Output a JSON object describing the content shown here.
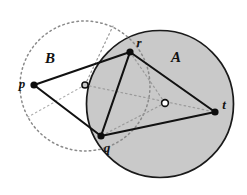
{
  "figure": {
    "width": 247,
    "height": 195,
    "background_color": "#ffffff"
  },
  "colors": {
    "disk_a_fill": "#c9c9c9",
    "disk_a_stroke": "#1a1a1a",
    "circle_b_stroke": "#8a8a8a",
    "segment_stroke": "#111111",
    "dotted_chord_stroke": "#9a9a9a",
    "point_fill": "#0d0d0d",
    "center_ring_stroke": "#111111",
    "center_a_fill": "#ffffff",
    "center_b_fill": "#c9c9c9",
    "label_color": "#111111"
  },
  "regions": [
    {
      "id": "disk-a",
      "label": "A",
      "label_x": 176,
      "label_y": 62,
      "center_x": 160,
      "center_y": 104,
      "radius": 73.5,
      "style": "solid",
      "filled": true
    },
    {
      "id": "circle-b",
      "label": "B",
      "label_x": 50,
      "label_y": 63,
      "center_x": 85,
      "center_y": 86,
      "radius": 65,
      "style": "dotted",
      "filled": false
    }
  ],
  "centers": [
    {
      "id": "center-b",
      "x": 85,
      "y": 85,
      "radius": 3.1,
      "fill": "#c9c9c9"
    },
    {
      "id": "center-a",
      "x": 165,
      "y": 103,
      "radius": 3.4,
      "fill": "#ffffff"
    }
  ],
  "points": [
    {
      "id": "p",
      "label": "p",
      "x": 34,
      "y": 85,
      "label_x": 22,
      "label_y": 88,
      "dot_radius": 3.6
    },
    {
      "id": "r",
      "label": "r",
      "x": 130,
      "y": 52,
      "label_x": 139,
      "label_y": 47,
      "dot_radius": 3.6
    },
    {
      "id": "q",
      "label": "q",
      "x": 101,
      "y": 136,
      "label_x": 107,
      "label_y": 152,
      "dot_radius": 3.6
    },
    {
      "id": "t",
      "label": "t",
      "x": 215,
      "y": 112,
      "label_x": 224,
      "label_y": 109,
      "dot_radius": 3.6
    }
  ],
  "segments": [
    {
      "id": "p-r",
      "from": "p",
      "to": "r",
      "x1": 34,
      "y1": 85,
      "x2": 130,
      "y2": 52,
      "style": "solid"
    },
    {
      "id": "p-q",
      "from": "p",
      "to": "q",
      "x1": 34,
      "y1": 85,
      "x2": 101,
      "y2": 136,
      "style": "solid"
    },
    {
      "id": "r-q",
      "from": "r",
      "to": "q",
      "x1": 130,
      "y1": 52,
      "x2": 101,
      "y2": 136,
      "style": "solid"
    },
    {
      "id": "r-t",
      "from": "r",
      "to": "t",
      "x1": 130,
      "y1": 52,
      "x2": 215,
      "y2": 112,
      "style": "solid"
    },
    {
      "id": "q-t",
      "from": "q",
      "to": "t",
      "x1": 101,
      "y1": 136,
      "x2": 215,
      "y2": 112,
      "style": "solid"
    }
  ],
  "dotted_lines": [
    {
      "id": "radius-b-upper",
      "x1": 85,
      "y1": 85,
      "x2": 113,
      "y2": 26,
      "style": "dotted"
    },
    {
      "id": "radius-b-lower-left",
      "x1": 85,
      "y1": 85,
      "x2": 28,
      "y2": 117,
      "style": "dotted"
    },
    {
      "id": "chord-b-center-to-t",
      "x1": 85,
      "y1": 85,
      "x2": 215,
      "y2": 112,
      "style": "dotted"
    },
    {
      "id": "chord-r-to-center-a",
      "x1": 130,
      "y1": 52,
      "x2": 165,
      "y2": 103,
      "style": "dotted"
    },
    {
      "id": "chord-center-a-to-q",
      "x1": 165,
      "y1": 103,
      "x2": 101,
      "y2": 136,
      "style": "dotted"
    }
  ]
}
